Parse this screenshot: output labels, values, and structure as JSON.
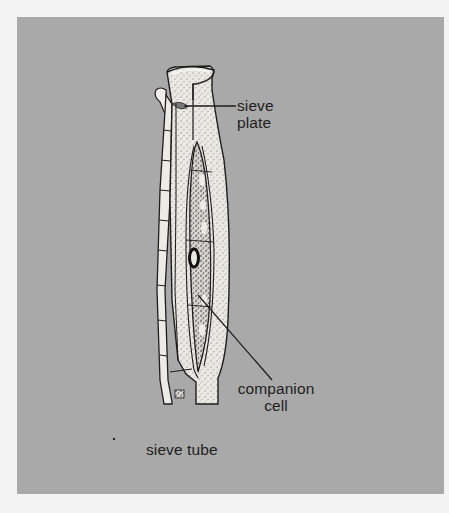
{
  "figure": {
    "colors": {
      "background": "#a9a9a9",
      "cell_fill": "#ecebe6",
      "outline": "#1e1e1e",
      "page": "#f4f4f4"
    }
  },
  "labels": {
    "sieve_plate": {
      "line1": "sieve",
      "line2": "plate"
    },
    "companion_cell": {
      "line1": "companion",
      "line2": "cell"
    },
    "sieve_tube": {
      "text": "sieve tube"
    }
  }
}
